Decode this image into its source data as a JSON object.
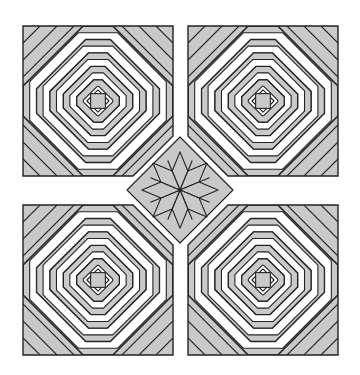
{
  "figure": {
    "title": "",
    "colors": {
      "background": "#ffffff",
      "fill_gray": "#c9c9c9",
      "fill_white": "#ffffff",
      "stroke": "#222222"
    },
    "blocks": [
      {
        "id": "pineapple-top-left",
        "x": 23,
        "y": 26,
        "size": 150,
        "cut_corner": "br"
      },
      {
        "id": "pineapple-top-right",
        "x": 188,
        "y": 26,
        "size": 150,
        "cut_corner": "bl"
      },
      {
        "id": "pineapple-bottom-left",
        "x": 23,
        "y": 205,
        "size": 150,
        "cut_corner": "tr"
      },
      {
        "id": "pineapple-bottom-right",
        "x": 188,
        "y": 205,
        "size": 150,
        "cut_corner": "tl"
      }
    ],
    "star": {
      "id": "eight-point-star",
      "cx": 180,
      "cy": 190,
      "half_diag": 53
    }
  }
}
